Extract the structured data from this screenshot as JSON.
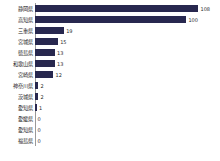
{
  "chart_data": {
    "type": "bar",
    "orientation": "horizontal",
    "title": "",
    "subtitle": "",
    "xlabel": "",
    "ylabel": "",
    "grid": false,
    "legend": "none",
    "xlim": [
      0,
      108
    ],
    "categories": [
      "静岡県",
      "高知県",
      "三重県",
      "宮城県",
      "徳島県",
      "和歌山県",
      "宮崎県",
      "神奈川県",
      "茨城県",
      "愛知県",
      "愛媛県",
      "愛知県",
      "福島県"
    ],
    "values": [
      108,
      100,
      19,
      15,
      13,
      13,
      12,
      2,
      2,
      1,
      0,
      0,
      0
    ],
    "value_labels": [
      "108",
      "100",
      "19",
      "15",
      "13",
      "13",
      "12",
      "2",
      "2",
      "1",
      "0",
      "0",
      "0"
    ],
    "bar_color": "#28284f",
    "axis_color": "#9a9a9a",
    "background_color": "#ffffff",
    "text_color": "#1a1a1a"
  }
}
